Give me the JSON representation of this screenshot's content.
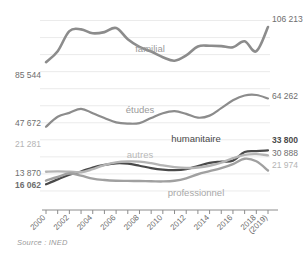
{
  "figure": {
    "title": "",
    "source": "Source : INED"
  },
  "chart_data": {
    "type": "line",
    "title": "",
    "xlabel": "",
    "ylabel": "",
    "grid": true,
    "legend": "inline-annotations",
    "x": [
      2000,
      2001,
      2002,
      2003,
      2004,
      2005,
      2006,
      2007,
      2008,
      2009,
      2010,
      2011,
      2012,
      2013,
      2014,
      2015,
      2016,
      2017,
      2018,
      2019
    ],
    "xtick_labels": [
      "2000",
      "2002",
      "2004",
      "2006",
      "2008",
      "2010",
      "2012",
      "2014",
      "2016",
      "2018",
      "(2019)"
    ],
    "ylim": [
      0,
      115000
    ],
    "series": [
      {
        "name": "familial",
        "color": "#8c8c8c",
        "width": 2.6,
        "label_x": 2006,
        "start_value": 85544,
        "end_value": 106213,
        "start_label": "85 544",
        "end_label": "106 213",
        "values": [
          85544,
          92000,
          103800,
          104800,
          102500,
          103200,
          105600,
          99000,
          94500,
          91800,
          88500,
          86400,
          89500,
          94800,
          95200,
          95000,
          94300,
          97800,
          92000,
          106213
        ]
      },
      {
        "name": "études",
        "color": "#8c8c8c",
        "width": 2.2,
        "label_x": 2008,
        "start_value": 47672,
        "end_value": 64262,
        "start_label": "47 672",
        "end_label": "64 262",
        "values": [
          47672,
          53500,
          55800,
          58200,
          55600,
          52800,
          50200,
          49500,
          49800,
          52800,
          55600,
          56800,
          55200,
          53000,
          54200,
          58600,
          63200,
          66000,
          66300,
          64262
        ]
      },
      {
        "name": "humanitaire",
        "color": "#4a4a4a",
        "width": 2.2,
        "label_x": 2014,
        "start_value": 13870,
        "end_value": 33800,
        "start_label": "13 870",
        "end_label": "33 800",
        "values": [
          13870,
          16800,
          19500,
          21400,
          23800,
          25300,
          26200,
          26000,
          24800,
          23400,
          22500,
          22200,
          22800,
          24600,
          26500,
          27200,
          27800,
          32800,
          33400,
          33800
        ]
      },
      {
        "name": "autres",
        "color": "#b4b4b4",
        "width": 2.4,
        "label_x": 2011,
        "start_value": 21281,
        "end_value": 30888,
        "start_label": "21 281",
        "end_label": "30 888",
        "values": [
          21281,
          21500,
          21300,
          21000,
          22800,
          25200,
          26800,
          27300,
          27200,
          26300,
          25000,
          24000,
          23500,
          23800,
          24800,
          26600,
          29200,
          31200,
          31600,
          30888
        ]
      },
      {
        "name": "professionnel",
        "color": "#a0a0a0",
        "width": 2.4,
        "label_x": 2013,
        "start_value": 16062,
        "end_value": 21974,
        "start_label": "16 062",
        "end_label": "21 974",
        "values": [
          16062,
          18200,
          20200,
          19000,
          17200,
          16400,
          16000,
          15900,
          15800,
          15700,
          15600,
          16000,
          17400,
          19800,
          21600,
          23400,
          25800,
          28900,
          27400,
          21974
        ]
      }
    ]
  }
}
